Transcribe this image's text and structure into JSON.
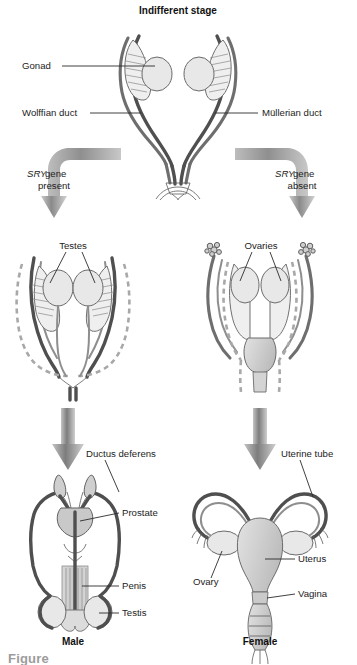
{
  "figure": {
    "title": "Indifferent stage",
    "caption_partial": "Figure"
  },
  "stages": {
    "indifferent": {
      "title": "Indifferent stage",
      "labels": {
        "gonad": "Gonad",
        "wolffian_duct": "Wolffian duct",
        "mullerian_duct": "Müllerian duct"
      }
    },
    "branches": [
      {
        "gene": "SRY",
        "rest": " gene",
        "state": "present",
        "side": "left",
        "pathway": "male"
      },
      {
        "gene": "SRY",
        "rest": " gene",
        "state": "absent",
        "side": "right",
        "pathway": "female"
      }
    ],
    "intermediate": {
      "male_label": "Testes",
      "female_label": "Ovaries"
    },
    "adult": {
      "male": {
        "caption": "Male",
        "labels": {
          "ductus_deferens": "Ductus deferens",
          "prostate": "Prostate",
          "penis": "Penis",
          "testis": "Testis"
        }
      },
      "female": {
        "caption": "Female",
        "labels": {
          "uterine_tube": "Uterine tube",
          "ovary": "Ovary",
          "uterus": "Uterus",
          "vagina": "Vagina"
        }
      }
    }
  },
  "colors": {
    "duct_gray": "#6e6e6e",
    "duct_dark": "#4f4f4f",
    "regressing_gray": "#a8a8a8",
    "organ_fill": "#e8e8e8",
    "organ_dark_fill": "#cfcfcf",
    "arrow_gray": "#8a8a8a",
    "text": "#1c1c1c",
    "background": "#ffffff"
  }
}
